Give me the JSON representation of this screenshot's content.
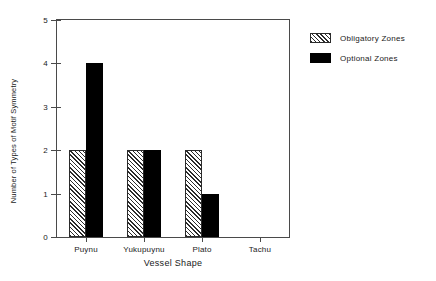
{
  "chart_data": {
    "type": "bar",
    "title": "",
    "subtitle": "",
    "xlabel": "Vessel Shape",
    "ylabel": "Number of Types of Motif Symmetry",
    "categories": [
      "Puynu",
      "Yukupuynu",
      "Plato",
      "Tachu"
    ],
    "series": [
      {
        "name": "Obligatory Zones",
        "fill": "hatched",
        "color": "#2b2b2b",
        "values": [
          2,
          2,
          2,
          0
        ]
      },
      {
        "name": "Optional Zones",
        "fill": "solid",
        "color": "#000000",
        "values": [
          4,
          2,
          1,
          0
        ]
      }
    ],
    "ylim": [
      0,
      5
    ],
    "ytick_labels": [
      "0",
      "1",
      "2",
      "3",
      "4",
      "5"
    ],
    "ytick_values": [
      0,
      1,
      2,
      3,
      4,
      5
    ],
    "grid": false,
    "legend_position": "right-top"
  },
  "legend": {
    "entries": [
      {
        "label": "Obligatory Zones"
      },
      {
        "label": "Optional Zones"
      }
    ]
  },
  "colors": {
    "axis": "#4a4a4a",
    "text": "#1a1a1a",
    "background": "#ffffff",
    "series_hatched": "#2b2b2b",
    "series_solid": "#000000"
  }
}
